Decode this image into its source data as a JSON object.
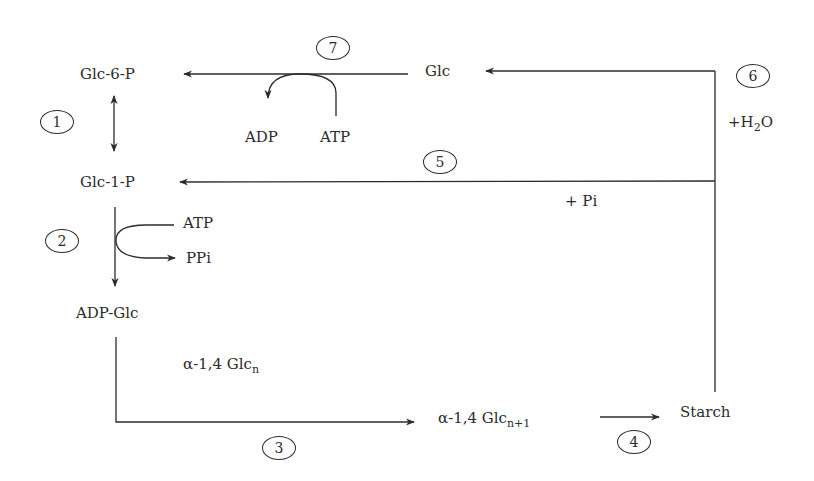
{
  "diagram": {
    "colors": {
      "line": "#2b2b2b",
      "background": "#ffffff"
    },
    "nodes": {
      "glc6p": "Glc-6-P",
      "glc": "Glc",
      "glc1p": "Glc-1-P",
      "adpglc": "ADP-Glc",
      "glcn_prefix": "α-1,4 Glc",
      "glcn_sub": "n",
      "glcn1_prefix": "α-1,4 Glc",
      "glcn1_sub": "n+1",
      "starch": "Starch"
    },
    "cofactors": {
      "adp_step7": "ADP",
      "atp_step7": "ATP",
      "atp_step2": "ATP",
      "ppi_step2": "PPi",
      "h2o_prefix": "+H",
      "h2o_sub": "2",
      "h2o_suffix": "O",
      "pi_step5": "+ Pi"
    },
    "steps": [
      "1",
      "2",
      "3",
      "4",
      "5",
      "6",
      "7"
    ]
  }
}
